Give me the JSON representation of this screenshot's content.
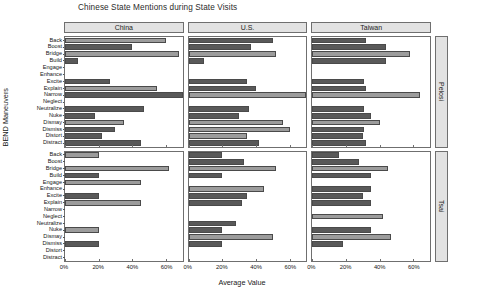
{
  "chart_data": {
    "type": "bar",
    "title": "Chinese State Mentions during State Visits",
    "xlabel": "Average Value",
    "ylabel": "BEND Maneuvers",
    "orientation": "horizontal",
    "grid": false,
    "legend": "none",
    "xlim": [
      0,
      70
    ],
    "xticks": [
      0,
      20,
      40,
      60
    ],
    "xticklabels": [
      "0%",
      "20%",
      "40%",
      "60%"
    ],
    "categories": [
      "Back",
      "Boost",
      "Bridge",
      "Build",
      "Engage",
      "Enhance",
      "Excite",
      "Explain",
      "Narrow",
      "Neglect",
      "Neutralize",
      "Nuke",
      "Dismay",
      "Dismiss",
      "Distort",
      "Distract"
    ],
    "col_facets": [
      "China",
      "U.S.",
      "Taiwan"
    ],
    "row_facets": [
      "Pelosi",
      "Tsai"
    ],
    "panels": [
      {
        "row": "Pelosi",
        "col": "China",
        "values": [
          60,
          40,
          68,
          8,
          0,
          0,
          27,
          55,
          70,
          0,
          47,
          18,
          35,
          30,
          22,
          45
        ]
      },
      {
        "row": "Pelosi",
        "col": "U.S.",
        "values": [
          50,
          37,
          52,
          9,
          0,
          0,
          35,
          40,
          70,
          0,
          36,
          30,
          56,
          60,
          35,
          42
        ]
      },
      {
        "row": "Pelosi",
        "col": "Taiwan",
        "values": [
          32,
          44,
          58,
          44,
          0,
          0,
          31,
          32,
          64,
          0,
          31,
          35,
          40,
          31,
          30,
          32
        ]
      },
      {
        "row": "Tsai",
        "col": "China",
        "values": [
          20,
          0,
          62,
          20,
          45,
          0,
          20,
          45,
          0,
          0,
          0,
          20,
          0,
          20,
          0,
          0
        ]
      },
      {
        "row": "Tsai",
        "col": "U.S.",
        "values": [
          20,
          33,
          52,
          20,
          0,
          45,
          35,
          32,
          0,
          0,
          28,
          20,
          50,
          20,
          0,
          0
        ]
      },
      {
        "row": "Tsai",
        "col": "Taiwan",
        "values": [
          16,
          28,
          45,
          35,
          0,
          35,
          30,
          35,
          0,
          42,
          0,
          35,
          47,
          18,
          0,
          0
        ]
      }
    ],
    "bar_colors": {
      "dark": "#595959",
      "light": "#9c9c9c"
    },
    "bar_shades": [
      [
        "light",
        "dark",
        "light",
        "dark",
        null,
        null,
        "dark",
        "light",
        "dark",
        null,
        "dark",
        "dark",
        "light",
        "dark",
        "dark",
        "dark"
      ],
      [
        "dark",
        "dark",
        "light",
        "dark",
        null,
        null,
        "dark",
        "dark",
        "light",
        null,
        "dark",
        "dark",
        "light",
        "light",
        "light",
        "dark"
      ],
      [
        "dark",
        "dark",
        "light",
        "dark",
        null,
        null,
        "dark",
        "dark",
        "light",
        null,
        "dark",
        "dark",
        "light",
        "dark",
        "dark",
        "dark"
      ],
      [
        "light",
        null,
        "light",
        "dark",
        "light",
        null,
        "dark",
        "light",
        null,
        null,
        null,
        "light",
        null,
        "dark",
        null,
        null
      ],
      [
        "dark",
        "dark",
        "light",
        "dark",
        null,
        "light",
        "dark",
        "dark",
        null,
        null,
        "dark",
        "dark",
        "light",
        "dark",
        null,
        null
      ],
      [
        "dark",
        "dark",
        "light",
        "dark",
        null,
        "dark",
        "dark",
        "dark",
        null,
        "light",
        null,
        "dark",
        "light",
        "dark",
        null,
        null
      ]
    ]
  },
  "strips": {
    "china": "China",
    "us": "U.S.",
    "taiwan": "Taiwan",
    "pelosi": "Pelosi",
    "tsai": "Tsai"
  }
}
